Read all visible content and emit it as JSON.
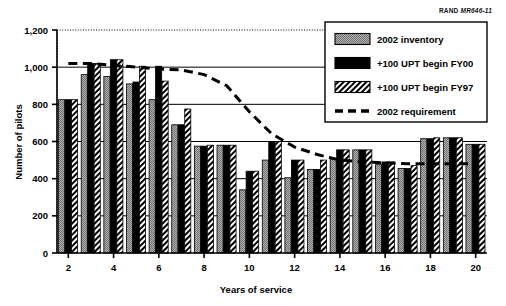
{
  "figure": {
    "source_id_prefix": "RAND",
    "source_id_code": "MR646-11"
  },
  "chart_data": {
    "type": "bar",
    "title": "",
    "xlabel": "Years of service",
    "ylabel": "Number of pilots",
    "xlim": [
      1.5,
      20.5
    ],
    "ylim": [
      0,
      1200
    ],
    "ytick_values": [
      0,
      200,
      400,
      600,
      800,
      1000,
      1200
    ],
    "ytick_labels": [
      "0",
      "200",
      "400",
      "600",
      "800",
      "1,000",
      "1,200"
    ],
    "xtick_values": [
      2,
      4,
      6,
      8,
      10,
      12,
      14,
      16,
      18,
      20
    ],
    "xtick_labels": [
      "2",
      "4",
      "6",
      "8",
      "10",
      "12",
      "14",
      "16",
      "18",
      "20"
    ],
    "grid": "horizontal-major",
    "legend_position": "top-right",
    "categories": [
      2,
      3,
      4,
      5,
      6,
      7,
      8,
      9,
      10,
      11,
      12,
      13,
      14,
      15,
      16,
      17,
      18,
      19,
      20
    ],
    "series": [
      {
        "name": "2002 inventory",
        "style": "gray-stipple",
        "values": [
          825,
          960,
          950,
          910,
          825,
          690,
          575,
          580,
          340,
          500,
          405,
          450,
          505,
          555,
          475,
          455,
          615,
          620,
          585
        ]
      },
      {
        "name": "+100 UPT begin FY00",
        "style": "solid-black",
        "values": [
          825,
          1020,
          1040,
          920,
          1005,
          690,
          575,
          580,
          440,
          600,
          500,
          450,
          555,
          555,
          490,
          455,
          615,
          620,
          585
        ]
      },
      {
        "name": "+100 UPT begin FY97",
        "style": "diagonal-hatch",
        "values": [
          825,
          1020,
          1040,
          1005,
          925,
          775,
          580,
          580,
          440,
          600,
          500,
          500,
          555,
          555,
          490,
          470,
          620,
          620,
          585
        ]
      }
    ],
    "line_series": [
      {
        "name": "2002 requirement",
        "style": "dashed",
        "x": [
          2,
          3,
          4,
          5,
          6,
          7,
          8,
          9,
          10,
          11,
          12,
          13,
          14,
          15,
          16,
          17,
          18,
          19,
          20
        ],
        "y": [
          1020,
          1020,
          1010,
          1000,
          990,
          985,
          960,
          900,
          760,
          640,
          570,
          530,
          500,
          490,
          485,
          480,
          480,
          480,
          480
        ]
      }
    ],
    "legend": [
      {
        "label": "2002 inventory",
        "style": "gray-stipple"
      },
      {
        "label": "+100 UPT begin FY00",
        "style": "solid-black"
      },
      {
        "label": "+100 UPT begin FY97",
        "style": "diagonal-hatch"
      },
      {
        "label": "2002 requirement",
        "style": "dashed-line"
      }
    ],
    "colors": {
      "bar_gray": "#9a9a9a",
      "bar_black": "#000000",
      "hatch_fg": "#000000",
      "hatch_bg": "#ffffff",
      "axis": "#000000",
      "grid": "#000000"
    }
  }
}
